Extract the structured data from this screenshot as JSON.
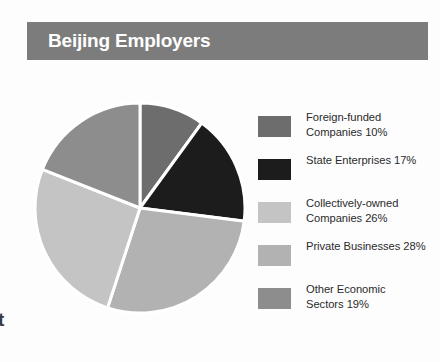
{
  "header": {
    "title": "Beijing Employers",
    "bar_color": "#7c7c7c",
    "title_color": "#ffffff"
  },
  "page_artifact": {
    "edge_text": "t"
  },
  "legend": {
    "items": [
      {
        "label": "Foreign-funded\nCompanies 10%",
        "color": "#6d6d6d",
        "swatch_name": "legend-swatch-foreign-funded"
      },
      {
        "label": "State Enterprises 17%",
        "color": "#1c1c1c",
        "swatch_name": "legend-swatch-state-enterprises"
      },
      {
        "label": "Collectively-owned\nCompanies 26%",
        "color": "#c4c4c4",
        "swatch_name": "legend-swatch-collectively-owned"
      },
      {
        "label": "Private Businesses 28%",
        "color": "#b2b2b2",
        "swatch_name": "legend-swatch-private-businesses"
      },
      {
        "label": "Other Economic\nSectors 19%",
        "color": "#8d8d8d",
        "swatch_name": "legend-swatch-other-economic"
      }
    ]
  },
  "chart_data": {
    "type": "pie",
    "title": "Beijing Employers",
    "subtitle": "",
    "xlabel": "",
    "ylabel": "",
    "unit": "%",
    "total": 100,
    "start_angle_deg": 0,
    "direction": "clockwise",
    "separator_color": "#ffffff",
    "separator_width_px": 3,
    "legend_position": "right",
    "grid": false,
    "categories": [
      "Foreign-funded Companies",
      "State Enterprises",
      "Private Businesses",
      "Collectively-owned Companies",
      "Other Economic Sectors"
    ],
    "values": [
      10,
      17,
      28,
      26,
      19
    ],
    "colors": [
      "#6d6d6d",
      "#1c1c1c",
      "#b2b2b2",
      "#c4c4c4",
      "#8d8d8d"
    ],
    "slices": [
      {
        "label": "Foreign-funded Companies",
        "value": 10,
        "color": "#6d6d6d",
        "start_deg": 0,
        "end_deg": 36
      },
      {
        "label": "State Enterprises",
        "value": 17,
        "color": "#1c1c1c",
        "start_deg": 36,
        "end_deg": 97.2
      },
      {
        "label": "Private Businesses",
        "value": 28,
        "color": "#b2b2b2",
        "start_deg": 97.2,
        "end_deg": 198
      },
      {
        "label": "Collectively-owned Companies",
        "value": 26,
        "color": "#c4c4c4",
        "start_deg": 198,
        "end_deg": 291.6
      },
      {
        "label": "Other Economic Sectors",
        "value": 19,
        "color": "#8d8d8d",
        "start_deg": 291.6,
        "end_deg": 360
      }
    ]
  }
}
